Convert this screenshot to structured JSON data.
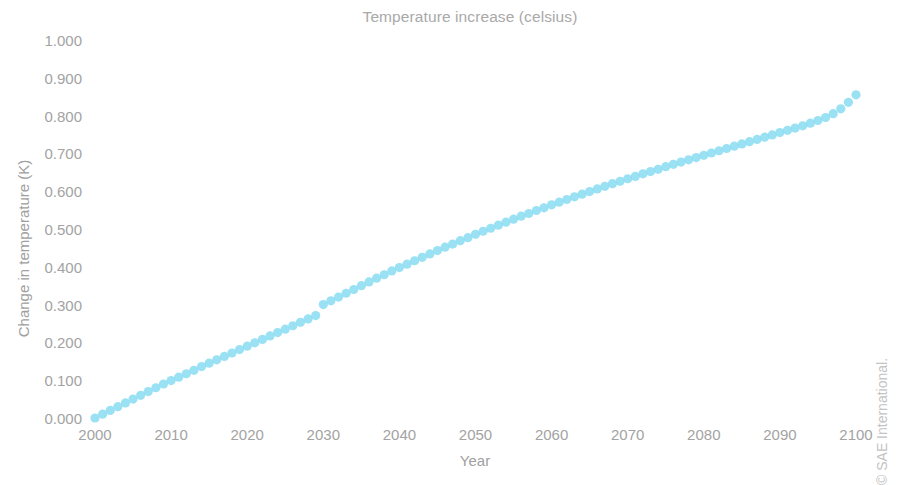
{
  "chart_data": {
    "type": "scatter",
    "title": "Temperature increase (celsius)",
    "subtitle": "",
    "xlabel": "Year",
    "ylabel": "Change in temperature (K)",
    "xlim": [
      2000,
      2100
    ],
    "ylim": [
      0.0,
      1.0
    ],
    "grid": false,
    "legend": false,
    "legend_position": "none",
    "marker": "circle",
    "marker_color": "#8adcf2",
    "background_color": "#ffffff",
    "text_color": "#a3a3a3",
    "x_tick_labels": [
      "2000",
      "2010",
      "2020",
      "2030",
      "2040",
      "2050",
      "2060",
      "2070",
      "2080",
      "2090",
      "2100"
    ],
    "x_ticks": [
      2000,
      2010,
      2020,
      2030,
      2040,
      2050,
      2060,
      2070,
      2080,
      2090,
      2100
    ],
    "y_tick_labels": [
      "0.000",
      "0.100",
      "0.200",
      "0.300",
      "0.400",
      "0.500",
      "0.600",
      "0.700",
      "0.800",
      "0.900",
      "1.000"
    ],
    "y_ticks": [
      0.0,
      0.1,
      0.2,
      0.3,
      0.4,
      0.5,
      0.6,
      0.7,
      0.8,
      0.9,
      1.0
    ],
    "annotations": [
      "© SAE International."
    ],
    "series": [
      {
        "name": "Temperature increase",
        "color": "#8adcf2",
        "x": [
          2000,
          2001,
          2002,
          2003,
          2004,
          2005,
          2006,
          2007,
          2008,
          2009,
          2010,
          2011,
          2012,
          2013,
          2014,
          2015,
          2016,
          2017,
          2018,
          2019,
          2020,
          2021,
          2022,
          2023,
          2024,
          2025,
          2026,
          2027,
          2028,
          2029,
          2030,
          2031,
          2032,
          2033,
          2034,
          2035,
          2036,
          2037,
          2038,
          2039,
          2040,
          2041,
          2042,
          2043,
          2044,
          2045,
          2046,
          2047,
          2048,
          2049,
          2050,
          2051,
          2052,
          2053,
          2054,
          2055,
          2056,
          2057,
          2058,
          2059,
          2060,
          2061,
          2062,
          2063,
          2064,
          2065,
          2066,
          2067,
          2068,
          2069,
          2070,
          2071,
          2072,
          2073,
          2074,
          2075,
          2076,
          2077,
          2078,
          2079,
          2080,
          2081,
          2082,
          2083,
          2084,
          2085,
          2086,
          2087,
          2088,
          2089,
          2090,
          2091,
          2092,
          2093,
          2094,
          2095,
          2096,
          2097,
          2098,
          2099,
          2100
        ],
        "values": [
          0.0,
          0.01,
          0.02,
          0.03,
          0.04,
          0.05,
          0.06,
          0.07,
          0.08,
          0.09,
          0.099,
          0.108,
          0.117,
          0.126,
          0.136,
          0.145,
          0.154,
          0.163,
          0.172,
          0.181,
          0.19,
          0.199,
          0.208,
          0.217,
          0.226,
          0.235,
          0.244,
          0.253,
          0.262,
          0.271,
          0.3,
          0.31,
          0.32,
          0.33,
          0.34,
          0.35,
          0.36,
          0.37,
          0.379,
          0.389,
          0.398,
          0.407,
          0.416,
          0.425,
          0.434,
          0.443,
          0.452,
          0.46,
          0.469,
          0.477,
          0.486,
          0.494,
          0.502,
          0.51,
          0.518,
          0.526,
          0.534,
          0.541,
          0.549,
          0.556,
          0.564,
          0.571,
          0.578,
          0.585,
          0.592,
          0.599,
          0.606,
          0.613,
          0.62,
          0.626,
          0.633,
          0.639,
          0.646,
          0.652,
          0.658,
          0.665,
          0.671,
          0.677,
          0.683,
          0.689,
          0.695,
          0.701,
          0.707,
          0.713,
          0.719,
          0.725,
          0.731,
          0.737,
          0.743,
          0.749,
          0.755,
          0.761,
          0.767,
          0.773,
          0.78,
          0.787,
          0.795,
          0.805,
          0.818,
          0.835,
          0.855
        ]
      }
    ]
  },
  "layout": {
    "plot_left": 95,
    "plot_right": 856,
    "plot_top": 40,
    "plot_bottom": 418,
    "marker_radius": 4.6
  }
}
